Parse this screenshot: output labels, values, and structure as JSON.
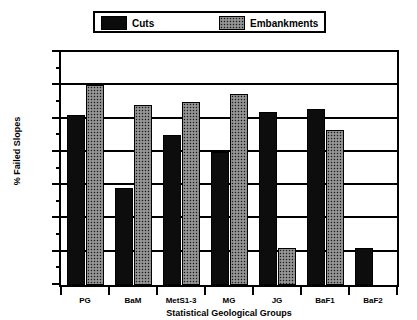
{
  "chart_data": {
    "type": "bar",
    "title": "",
    "subtitle": "",
    "xlabel": "Statistical Geological Groups",
    "ylabel": "% Failed Slopes",
    "categories": [
      "PG",
      "BaM",
      "MetS1-3",
      "MG",
      "JG",
      "BaF1",
      "BaF2"
    ],
    "series": [
      {
        "name": "Cuts",
        "values": [
          51,
          29,
          45,
          40,
          52,
          53,
          11
        ],
        "color": "#0d0d0d",
        "fill": "solid"
      },
      {
        "name": "Embankments",
        "values": [
          60,
          54,
          55,
          57.5,
          11,
          46.5,
          null
        ],
        "color": "#1c1c1c",
        "fill": "stipple"
      }
    ],
    "ylim": [
      0,
      70
    ],
    "y_major_ticks": [
      0,
      10,
      20,
      30,
      40,
      50,
      60,
      70
    ],
    "y_minor_ticks": [
      5,
      15,
      25,
      35,
      45,
      55,
      65
    ],
    "y_ticklabels": [
      "0",
      "10",
      "20",
      "30",
      "40",
      "50",
      "60",
      "70"
    ],
    "grid": "horizontal",
    "legend_position": "top-center",
    "frame": true
  },
  "legend": {
    "entries": [
      {
        "label": "Cuts",
        "swatch": "solid-black-swatch"
      },
      {
        "label": "Embankments",
        "swatch": "stipple-gray-swatch"
      }
    ]
  },
  "colors": {
    "background": "#ffffff",
    "axis": "#000000",
    "cuts": "#0d0d0d",
    "embankments": "#1c1c1c"
  }
}
